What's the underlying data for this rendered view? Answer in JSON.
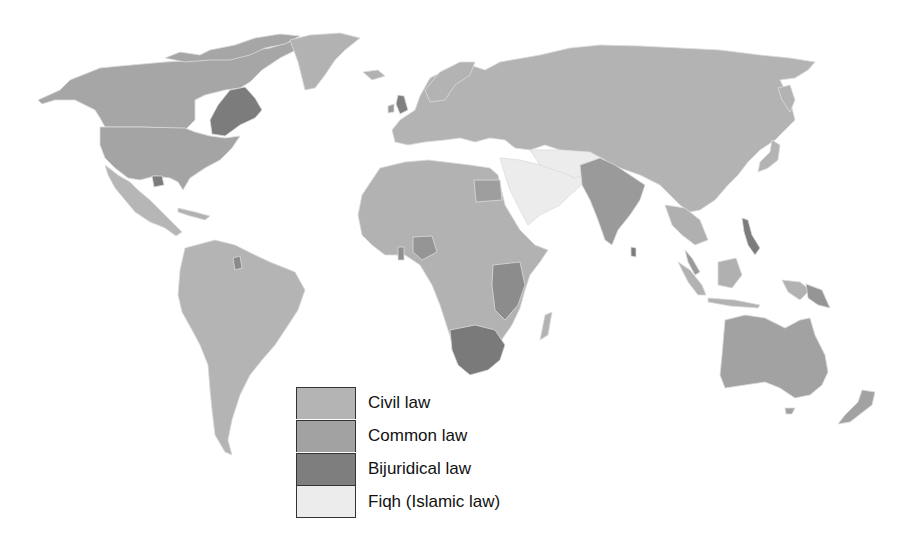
{
  "map": {
    "title": "World legal systems",
    "colors": {
      "civil": "#b4b4b4",
      "common": "#a2a2a2",
      "bijuridical": "#7e7e7e",
      "fiqh": "#ececec",
      "water": "#ffffff"
    }
  },
  "legend": {
    "items": [
      {
        "key": "civil",
        "label": "Civil law",
        "color": "#b4b4b4"
      },
      {
        "key": "common",
        "label": "Common law",
        "color": "#a2a2a2"
      },
      {
        "key": "bijuridical",
        "label": "Bijuridical law",
        "color": "#7e7e7e"
      },
      {
        "key": "fiqh",
        "label": "Fiqh (Islamic law)",
        "color": "#ececec"
      }
    ]
  }
}
